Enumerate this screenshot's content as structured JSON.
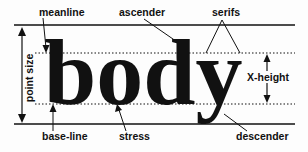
{
  "diagram": {
    "word": "body",
    "labels": {
      "meanline": "meanline",
      "ascender": "ascender",
      "serifs": "serifs",
      "point_size": "point size",
      "x_height": "X-height",
      "base_line": "base-line",
      "stress": "stress",
      "descender": "descender"
    },
    "colors": {
      "ink": "#111111",
      "background": "#fdfdfd"
    }
  }
}
